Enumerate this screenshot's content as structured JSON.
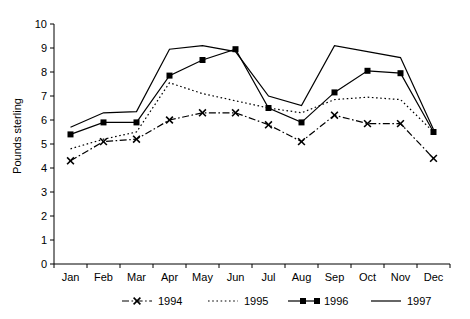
{
  "chart_data": {
    "type": "line",
    "title": "",
    "xlabel": "",
    "ylabel": "Pounds sterling",
    "categories": [
      "Jan",
      "Feb",
      "Mar",
      "Apr",
      "May",
      "Jun",
      "Jul",
      "Aug",
      "Sep",
      "Oct",
      "Nov",
      "Dec"
    ],
    "ylim": [
      0,
      10
    ],
    "yticks": [
      0,
      1,
      2,
      3,
      4,
      5,
      6,
      7,
      8,
      9,
      10
    ],
    "ytick_labels": [
      "0",
      "1",
      "2",
      "3",
      "4",
      "5",
      "6",
      "7",
      "8",
      "9",
      "10"
    ],
    "grid": false,
    "legend_position": "below-axes",
    "series": [
      {
        "name": "1994",
        "style": "dash-dot",
        "marker": "x-cross",
        "color": "#000000",
        "values": [
          4.3,
          5.1,
          5.2,
          6.0,
          6.3,
          6.3,
          5.8,
          5.1,
          6.2,
          5.85,
          5.85,
          4.4
        ]
      },
      {
        "name": "1995",
        "style": "dotted",
        "marker": "none",
        "color": "#000000",
        "values": [
          4.8,
          5.2,
          5.5,
          7.55,
          7.1,
          6.8,
          6.5,
          6.3,
          6.85,
          6.95,
          6.85,
          5.5
        ]
      },
      {
        "name": "1996",
        "style": "solid",
        "marker": "square",
        "color": "#000000",
        "values": [
          5.4,
          5.9,
          5.9,
          7.85,
          8.5,
          8.95,
          6.5,
          5.9,
          7.15,
          8.05,
          7.95,
          5.5
        ]
      },
      {
        "name": "1997",
        "style": "solid",
        "marker": "none",
        "color": "#000000",
        "values": [
          5.7,
          6.3,
          6.35,
          8.95,
          9.1,
          8.85,
          7.0,
          6.6,
          9.1,
          8.85,
          8.6,
          5.6
        ]
      }
    ]
  },
  "axes": {
    "ylabel": "Pounds sterling"
  },
  "legend": {
    "entries": [
      {
        "label": "1994"
      },
      {
        "label": "1995"
      },
      {
        "label": "1996"
      },
      {
        "label": "1997"
      }
    ]
  }
}
